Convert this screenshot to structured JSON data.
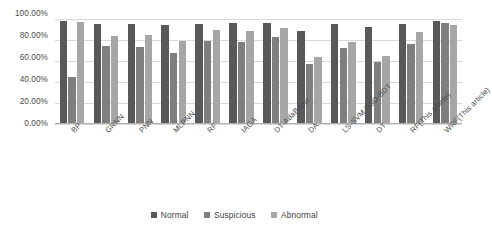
{
  "chart_data": {
    "type": "bar",
    "title": "",
    "subtitle": "",
    "xlabel": "",
    "ylabel": "",
    "ylim": [
      0,
      100
    ],
    "ytick_labels": [
      "100.00%",
      "80.00%",
      "60.00%",
      "40.00%",
      "20.00%",
      "0.00%"
    ],
    "ytick_values": [
      100,
      80,
      60,
      40,
      20,
      0
    ],
    "grid": true,
    "grid_axis": "y",
    "legend_position": "bottom",
    "categories": [
      "BP",
      "GRNN",
      "PNN",
      "MLPNN",
      "RF",
      "IAGA",
      "DT-AdaBoost",
      "DA",
      "LS-SVM-PSO-BDT",
      "DT",
      "RF(This article)",
      "WRF(This article)"
    ],
    "series": [
      {
        "name": "Normal",
        "color": "#595959",
        "values": [
          98.0,
          95.5,
          95.0,
          94.0,
          95.5,
          96.0,
          96.0,
          88.5,
          95.0,
          92.0,
          95.0,
          98.5
        ]
      },
      {
        "name": "Suspicious",
        "color": "#7f7f7f",
        "values": [
          45.0,
          74.0,
          73.5,
          68.0,
          79.0,
          78.5,
          83.0,
          57.5,
          72.0,
          59.0,
          76.5,
          96.5
        ]
      },
      {
        "name": "Abnormal",
        "color": "#a6a6a6",
        "values": [
          97.0,
          84.0,
          85.0,
          79.5,
          90.0,
          88.5,
          91.0,
          64.0,
          78.0,
          65.0,
          87.5,
          94.0
        ]
      }
    ]
  }
}
